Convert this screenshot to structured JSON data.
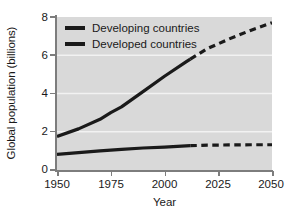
{
  "chart_data": {
    "type": "line",
    "title": "",
    "xlabel": "Year",
    "ylabel": "Global population (billions)",
    "xlim": [
      1950,
      2050
    ],
    "ylim": [
      0,
      8
    ],
    "xticks": [
      "1950",
      "1975",
      "2000",
      "2025",
      "2050"
    ],
    "yticks": [
      "0",
      "2",
      "4",
      "6",
      "8"
    ],
    "grid": "horizontal-white",
    "legend_position": "upper-left-inside",
    "projection_start_year": 2012,
    "series": [
      {
        "name": "Developing countries",
        "color": "#1a1a1a",
        "x": [
          1950,
          1960,
          1970,
          1975,
          1980,
          1990,
          2000,
          2010,
          2012,
          2020,
          2030,
          2040,
          2050
        ],
        "values": [
          1.75,
          2.15,
          2.65,
          3.0,
          3.3,
          4.1,
          4.9,
          5.65,
          5.8,
          6.35,
          6.85,
          7.3,
          7.7
        ],
        "style_solid_until": 2012,
        "style_after": "dashed"
      },
      {
        "name": "Developed countries",
        "color": "#1a1a1a",
        "x": [
          1950,
          1960,
          1970,
          1975,
          1980,
          1990,
          2000,
          2010,
          2012,
          2020,
          2030,
          2040,
          2050
        ],
        "values": [
          0.82,
          0.91,
          1.0,
          1.04,
          1.08,
          1.15,
          1.2,
          1.26,
          1.27,
          1.3,
          1.31,
          1.32,
          1.32
        ],
        "style_solid_until": 2012,
        "style_after": "dashed"
      }
    ]
  },
  "axes": {
    "ylabel": "Global population (billions)",
    "xlabel": "Year",
    "yticks": [
      {
        "label": "8",
        "value": 8
      },
      {
        "label": "6",
        "value": 6
      },
      {
        "label": "4",
        "value": 4
      },
      {
        "label": "2",
        "value": 2
      },
      {
        "label": "0",
        "value": 0
      }
    ],
    "xticks": [
      {
        "label": "1950",
        "value": 1950
      },
      {
        "label": "1975",
        "value": 1975
      },
      {
        "label": "2000",
        "value": 2000
      },
      {
        "label": "2025",
        "value": 2025
      },
      {
        "label": "2050",
        "value": 2050
      }
    ]
  },
  "legend": {
    "items": [
      {
        "label": "Developing countries",
        "color": "#1a1a1a"
      },
      {
        "label": "Developed countries",
        "color": "#1a1a1a"
      }
    ]
  },
  "colors": {
    "plot_background": "#d9d9d9",
    "gridline": "#f2f2f2",
    "axis": "#7d7d7d",
    "line": "#1a1a1a",
    "text": "#1a1a1a",
    "page_background": "#ffffff"
  }
}
